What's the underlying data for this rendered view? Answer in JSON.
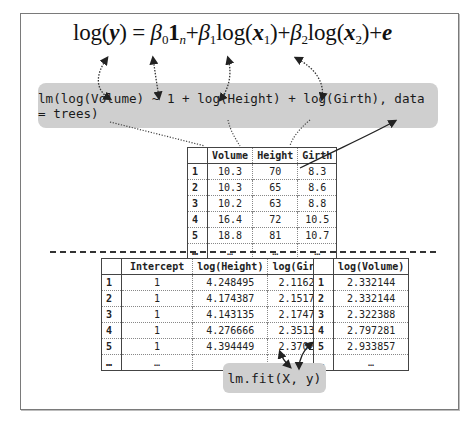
{
  "formula": {
    "parts": [
      "log(",
      "y",
      ") = ",
      "β",
      "0",
      "1",
      "n",
      "+",
      "β",
      "1",
      "log(",
      "x",
      "1",
      ")+",
      "β",
      "2",
      "log(",
      "x",
      "2",
      ")+",
      "e"
    ]
  },
  "model_call": "lm(log(Volume) ~ 1 + log(Height) + log(Girth), data = trees)",
  "fit_call": "lm.fit(X, y)",
  "trees_table": {
    "headers": [
      "",
      "Volume",
      "Height",
      "Girth"
    ],
    "rows": [
      [
        "1",
        "10.3",
        "70",
        "8.3"
      ],
      [
        "2",
        "10.3",
        "65",
        "8.6"
      ],
      [
        "3",
        "10.2",
        "63",
        "8.8"
      ],
      [
        "4",
        "16.4",
        "72",
        "10.5"
      ],
      [
        "5",
        "18.8",
        "81",
        "10.7"
      ],
      [
        "…",
        "…",
        "…",
        "…"
      ]
    ]
  },
  "X_table": {
    "headers": [
      "",
      "Intercept",
      "log(Height)",
      "log(Girth)"
    ],
    "rows": [
      [
        "1",
        "1",
        "4.248495",
        "2.116256"
      ],
      [
        "2",
        "1",
        "4.174387",
        "2.151762"
      ],
      [
        "3",
        "1",
        "4.143135",
        "2.174752"
      ],
      [
        "4",
        "1",
        "4.276666",
        "2.351375"
      ],
      [
        "5",
        "1",
        "4.394449",
        "2.370244"
      ],
      [
        "…",
        "…",
        "…",
        "…"
      ]
    ]
  },
  "y_table": {
    "headers": [
      "",
      "log(Volume)"
    ],
    "rows": [
      [
        "1",
        "2.332144"
      ],
      [
        "2",
        "2.332144"
      ],
      [
        "3",
        "2.322388"
      ],
      [
        "4",
        "2.797281"
      ],
      [
        "5",
        "2.933857"
      ],
      [
        "…",
        "…"
      ]
    ]
  },
  "colors": {
    "code_box_bg": "#cfcfcf",
    "frame_border": "#7a7a7a",
    "arrow": "#333333"
  }
}
